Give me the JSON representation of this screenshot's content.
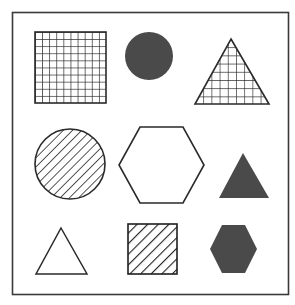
{
  "figure": {
    "background": "#ffffff",
    "frame": {
      "x": 12.5,
      "y": 12.5,
      "width": 276,
      "height": 282,
      "stroke": "#3a3a3a",
      "stroke_width": 1.6
    },
    "colors": {
      "outline": "#2a2a2a",
      "fill_dark": "#4a4a4a"
    }
  },
  "shapes": [
    {
      "id": "grid-square",
      "shape": "square",
      "pattern": "grid",
      "row": 1,
      "col": 1
    },
    {
      "id": "solid-circle",
      "shape": "circle",
      "pattern": "solid",
      "row": 1,
      "col": 2
    },
    {
      "id": "grid-triangle",
      "shape": "triangle",
      "pattern": "grid",
      "row": 1,
      "col": 3
    },
    {
      "id": "hatched-circle",
      "shape": "circle",
      "pattern": "diagonal-hatch",
      "row": 2,
      "col": 1
    },
    {
      "id": "outline-hexagon",
      "shape": "hexagon",
      "pattern": "none",
      "row": 2,
      "col": 2
    },
    {
      "id": "solid-triangle",
      "shape": "triangle",
      "pattern": "solid",
      "row": 2,
      "col": 3
    },
    {
      "id": "outline-triangle",
      "shape": "triangle",
      "pattern": "none",
      "row": 3,
      "col": 1
    },
    {
      "id": "hatched-square",
      "shape": "square",
      "pattern": "diagonal-hatch",
      "row": 3,
      "col": 2
    },
    {
      "id": "solid-hexagon",
      "shape": "hexagon",
      "pattern": "solid",
      "row": 3,
      "col": 3
    }
  ]
}
